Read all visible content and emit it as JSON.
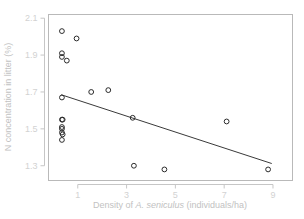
{
  "chart_data": {
    "type": "scatter",
    "title": "",
    "xlabel": "Density of A. seniculus (individuals/ha)",
    "xlabel_parts": {
      "prefix": "Density of ",
      "italic": "A. seniculus",
      "suffix": " (individuals/ha)"
    },
    "ylabel": "N concentration in litter (%)",
    "xlim": [
      -0.2,
      9.8
    ],
    "ylim": [
      1.22,
      2.12
    ],
    "xticks": [
      1,
      3,
      5,
      7,
      9
    ],
    "xtick_labels": [
      "1",
      "3",
      "5",
      "7",
      "9"
    ],
    "yticks": [
      1.3,
      1.5,
      1.7,
      1.9,
      2.1
    ],
    "ytick_labels": [
      "1.3",
      "1.5",
      "1.7",
      "1.9",
      "2.1"
    ],
    "grid": false,
    "legend": false,
    "marker": "open-circle",
    "marker_color": "#2b2b2b",
    "points": [
      {
        "x": 0.35,
        "y": 2.03
      },
      {
        "x": 0.35,
        "y": 1.91
      },
      {
        "x": 0.35,
        "y": 1.89
      },
      {
        "x": 0.55,
        "y": 1.87
      },
      {
        "x": 0.95,
        "y": 1.99
      },
      {
        "x": 0.35,
        "y": 1.67
      },
      {
        "x": 1.55,
        "y": 1.7
      },
      {
        "x": 2.25,
        "y": 1.71
      },
      {
        "x": 0.35,
        "y": 1.55
      },
      {
        "x": 0.38,
        "y": 1.55
      },
      {
        "x": 0.35,
        "y": 1.51
      },
      {
        "x": 0.35,
        "y": 1.5
      },
      {
        "x": 0.35,
        "y": 1.48
      },
      {
        "x": 0.38,
        "y": 1.47
      },
      {
        "x": 0.35,
        "y": 1.44
      },
      {
        "x": 3.25,
        "y": 1.56
      },
      {
        "x": 7.1,
        "y": 1.54
      },
      {
        "x": 3.3,
        "y": 1.3
      },
      {
        "x": 4.55,
        "y": 1.28
      },
      {
        "x": 8.8,
        "y": 1.28
      }
    ],
    "regression_line": {
      "x_start": 0.32,
      "y_start": 1.685,
      "x_end": 8.95,
      "y_end": 1.312,
      "color": "#3a3a3a"
    }
  },
  "colors": {
    "background": "#ffffff",
    "axis": "#c6c6c6",
    "panel_border": "#b9b9b9",
    "tick_text": "#d2d2d2",
    "axis_title_text": "#c2c2c2",
    "marker_stroke": "#2b2b2b",
    "regression": "#3a3a3a"
  }
}
